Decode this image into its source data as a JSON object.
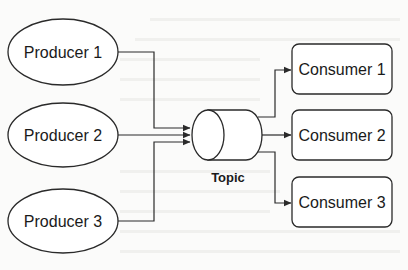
{
  "diagram": {
    "type": "publish-subscribe",
    "producers": [
      {
        "label": "Producer 1"
      },
      {
        "label": "Producer 2"
      },
      {
        "label": "Producer 3"
      }
    ],
    "topic": {
      "label": "Topic"
    },
    "consumers": [
      {
        "label": "Consumer 1"
      },
      {
        "label": "Consumer 2"
      },
      {
        "label": "Consumer 3"
      }
    ],
    "edges": [
      {
        "from": "Producer 1",
        "to": "Topic"
      },
      {
        "from": "Producer 2",
        "to": "Topic"
      },
      {
        "from": "Producer 3",
        "to": "Topic"
      },
      {
        "from": "Topic",
        "to": "Consumer 1"
      },
      {
        "from": "Topic",
        "to": "Consumer 2"
      },
      {
        "from": "Topic",
        "to": "Consumer 3"
      }
    ]
  },
  "colors": {
    "stroke": "#2a2a2a",
    "fill": "#ffffff",
    "background": "#fbfbfa"
  }
}
